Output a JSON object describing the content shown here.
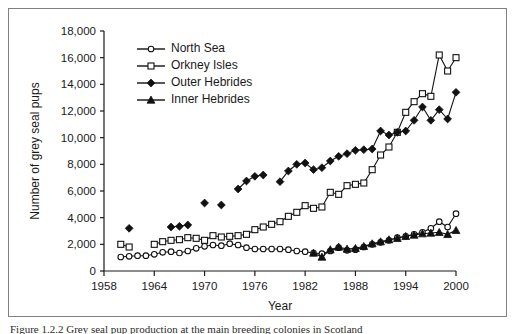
{
  "figure": {
    "caption": "Figure 1.2.2   Grey seal pup production at the main breeding colonies in Scotland",
    "border_color": "#808080",
    "ink_color": "#111111",
    "background": "#ffffff"
  },
  "chart_data": {
    "type": "line",
    "title": "",
    "xlabel": "Year",
    "ylabel": "Number of grey seal pups",
    "xlim": [
      1958,
      2000
    ],
    "ylim": [
      0,
      18000
    ],
    "xticks": [
      1958,
      1964,
      1970,
      1976,
      1982,
      1988,
      1994,
      2000
    ],
    "xtick_labels": [
      "1958",
      "1964",
      "1970",
      "1976",
      "1982",
      "1988",
      "1994",
      "2000"
    ],
    "yticks": [
      0,
      2000,
      4000,
      6000,
      8000,
      10000,
      12000,
      14000,
      16000,
      18000
    ],
    "ytick_labels": [
      "0",
      "2,000",
      "4,000",
      "6,000",
      "8,000",
      "10,000",
      "12,000",
      "14,000",
      "16,000",
      "18,000"
    ],
    "grid": false,
    "legend_position": "top-left-inside",
    "series": [
      {
        "name": "North Sea",
        "marker": "open-circle",
        "connected": true,
        "points": [
          [
            1960,
            1050
          ],
          [
            1961,
            1100
          ],
          [
            1962,
            1150
          ],
          [
            1963,
            1150
          ],
          [
            1964,
            1250
          ],
          [
            1965,
            1400
          ],
          [
            1966,
            1450
          ],
          [
            1967,
            1350
          ],
          [
            1968,
            1500
          ],
          [
            1969,
            1700
          ],
          [
            1970,
            1850
          ],
          [
            1971,
            1950
          ],
          [
            1972,
            1900
          ],
          [
            1973,
            2050
          ],
          [
            1974,
            1950
          ],
          [
            1975,
            1750
          ],
          [
            1976,
            1650
          ],
          [
            1977,
            1650
          ],
          [
            1978,
            1650
          ],
          [
            1979,
            1650
          ],
          [
            1980,
            1600
          ],
          [
            1981,
            1500
          ],
          [
            1982,
            1450
          ],
          [
            1983,
            1350
          ],
          [
            1984,
            1300
          ],
          [
            1985,
            1500
          ],
          [
            1986,
            1750
          ],
          [
            1987,
            1550
          ],
          [
            1988,
            1600
          ],
          [
            1989,
            1800
          ],
          [
            1990,
            2000
          ],
          [
            1991,
            2150
          ],
          [
            1992,
            2300
          ],
          [
            1993,
            2500
          ],
          [
            1994,
            2600
          ],
          [
            1995,
            2750
          ],
          [
            1996,
            2900
          ],
          [
            1997,
            3200
          ],
          [
            1998,
            3700
          ],
          [
            1999,
            3300
          ],
          [
            2000,
            4300
          ]
        ]
      },
      {
        "name": "Orkney Isles",
        "marker": "open-square",
        "connected": true,
        "points": [
          [
            1960,
            2000
          ],
          [
            1961,
            1800
          ],
          [
            1964,
            2000
          ],
          [
            1965,
            2200
          ],
          [
            1966,
            2300
          ],
          [
            1967,
            2350
          ],
          [
            1968,
            2500
          ],
          [
            1969,
            2450
          ],
          [
            1970,
            2300
          ],
          [
            1971,
            2650
          ],
          [
            1972,
            2550
          ],
          [
            1973,
            2600
          ],
          [
            1974,
            2650
          ],
          [
            1975,
            2750
          ],
          [
            1976,
            3100
          ],
          [
            1977,
            3300
          ],
          [
            1978,
            3500
          ],
          [
            1979,
            3700
          ],
          [
            1980,
            4100
          ],
          [
            1981,
            4400
          ],
          [
            1982,
            4900
          ],
          [
            1983,
            4700
          ],
          [
            1984,
            4800
          ],
          [
            1985,
            5900
          ],
          [
            1986,
            5750
          ],
          [
            1987,
            6400
          ],
          [
            1988,
            6500
          ],
          [
            1989,
            6600
          ],
          [
            1990,
            7600
          ],
          [
            1991,
            8700
          ],
          [
            1992,
            9300
          ],
          [
            1993,
            10400
          ],
          [
            1994,
            11900
          ],
          [
            1995,
            12700
          ],
          [
            1996,
            13300
          ],
          [
            1997,
            13100
          ],
          [
            1998,
            16200
          ],
          [
            1999,
            15000
          ],
          [
            2000,
            16000
          ]
        ]
      },
      {
        "name": "Outer Hebrides",
        "marker": "solid-diamond",
        "connected": true,
        "points": [
          [
            1961,
            3200
          ],
          [
            1966,
            3300
          ],
          [
            1967,
            3350
          ],
          [
            1968,
            3450
          ],
          [
            1970,
            5100
          ],
          [
            1972,
            4950
          ],
          [
            1974,
            6150
          ],
          [
            1975,
            6750
          ],
          [
            1976,
            7100
          ],
          [
            1977,
            7200
          ],
          [
            1979,
            6700
          ],
          [
            1980,
            7500
          ],
          [
            1981,
            8000
          ],
          [
            1982,
            8100
          ],
          [
            1983,
            7600
          ],
          [
            1984,
            7750
          ],
          [
            1985,
            8250
          ],
          [
            1986,
            8600
          ],
          [
            1987,
            8800
          ],
          [
            1988,
            9050
          ],
          [
            1989,
            9100
          ],
          [
            1990,
            9150
          ],
          [
            1991,
            10500
          ],
          [
            1992,
            10200
          ],
          [
            1993,
            10400
          ],
          [
            1994,
            10500
          ],
          [
            1995,
            11300
          ],
          [
            1996,
            12300
          ],
          [
            1997,
            11300
          ],
          [
            1998,
            12100
          ],
          [
            1999,
            11400
          ],
          [
            2000,
            13400
          ]
        ]
      },
      {
        "name": "Inner Hebrides",
        "marker": "solid-triangle",
        "connected": true,
        "points": [
          [
            1983,
            1350
          ],
          [
            1984,
            1050
          ],
          [
            1985,
            1600
          ],
          [
            1986,
            1800
          ],
          [
            1987,
            1650
          ],
          [
            1988,
            1700
          ],
          [
            1989,
            1850
          ],
          [
            1990,
            2050
          ],
          [
            1991,
            2200
          ],
          [
            1992,
            2350
          ],
          [
            1993,
            2450
          ],
          [
            1994,
            2600
          ],
          [
            1995,
            2700
          ],
          [
            1996,
            2800
          ],
          [
            1997,
            2850
          ],
          [
            1998,
            2900
          ],
          [
            1999,
            2750
          ],
          [
            2000,
            3050
          ]
        ]
      }
    ],
    "legend_entries": [
      {
        "label": "North Sea",
        "marker": "open-circle"
      },
      {
        "label": "Orkney Isles",
        "marker": "open-square"
      },
      {
        "label": "Outer Hebrides",
        "marker": "solid-diamond"
      },
      {
        "label": "Inner Hebrides",
        "marker": "solid-triangle"
      }
    ]
  }
}
